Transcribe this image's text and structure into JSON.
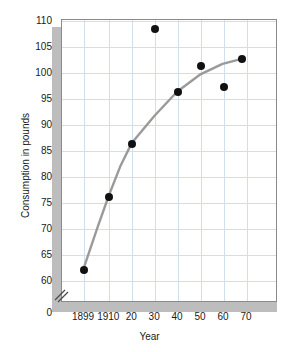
{
  "chart_data": {
    "type": "scatter",
    "title": "",
    "xlabel": "Year",
    "ylabel": "Consumption in pounds",
    "x": [
      1899,
      1910,
      1920,
      1930,
      1940,
      1950,
      1960,
      1968
    ],
    "values": [
      62.2,
      76.2,
      86.3,
      108.5,
      96.3,
      101.4,
      97.4,
      102.6
    ],
    "series": [
      {
        "name": "Consumption",
        "points": [
          {
            "x": 1899,
            "y": 62.2
          },
          {
            "x": 1910,
            "y": 76.2
          },
          {
            "x": 1920,
            "y": 86.3
          },
          {
            "x": 1930,
            "y": 108.5
          },
          {
            "x": 1940,
            "y": 96.3
          },
          {
            "x": 1950,
            "y": 101.4
          },
          {
            "x": 1960,
            "y": 97.4
          },
          {
            "x": 1968,
            "y": 102.6
          }
        ]
      },
      {
        "name": "Fitted curve",
        "type": "line",
        "points": [
          {
            "x": 1899,
            "y": 62.2
          },
          {
            "x": 1905,
            "y": 70.0
          },
          {
            "x": 1910,
            "y": 76.2
          },
          {
            "x": 1915,
            "y": 81.8
          },
          {
            "x": 1920,
            "y": 86.3
          },
          {
            "x": 1930,
            "y": 91.6
          },
          {
            "x": 1940,
            "y": 96.3
          },
          {
            "x": 1950,
            "y": 99.6
          },
          {
            "x": 1960,
            "y": 101.7
          },
          {
            "x": 1968,
            "y": 102.6
          }
        ]
      }
    ],
    "xticks": [
      "1899",
      "1910",
      "20",
      "30",
      "40",
      "50",
      "60",
      "70"
    ],
    "xtick_values": [
      1899,
      1910,
      1920,
      1930,
      1940,
      1950,
      1960,
      1970
    ],
    "yticks": [
      "0",
      "60",
      "65",
      "70",
      "75",
      "80",
      "85",
      "90",
      "95",
      "100",
      "105",
      "110"
    ],
    "ytick_values": [
      0,
      60,
      65,
      70,
      75,
      80,
      85,
      90,
      95,
      100,
      105,
      110
    ],
    "ylim": [
      60,
      110
    ],
    "xlim": [
      1895,
      1974
    ],
    "axis_break": true,
    "axis_break_label": "y-axis-break",
    "grid": true,
    "legend": "none",
    "colors": {
      "grid": "#cfe0ec",
      "curve": "#9a9a9a",
      "marker": "#111111",
      "frame": "#8a8a8a",
      "shadow": "#bdbdbd",
      "background": "#ffffff",
      "text": "#1a1a1a"
    }
  },
  "labels": {
    "y": [
      "110",
      "105",
      "100",
      "95",
      "90",
      "85",
      "80",
      "75",
      "70",
      "65",
      "60",
      "0"
    ],
    "x": [
      "1899",
      "1910",
      "20",
      "30",
      "40",
      "50",
      "60",
      "70"
    ],
    "x_title": "Year",
    "y_title": "Consumption in pounds"
  }
}
